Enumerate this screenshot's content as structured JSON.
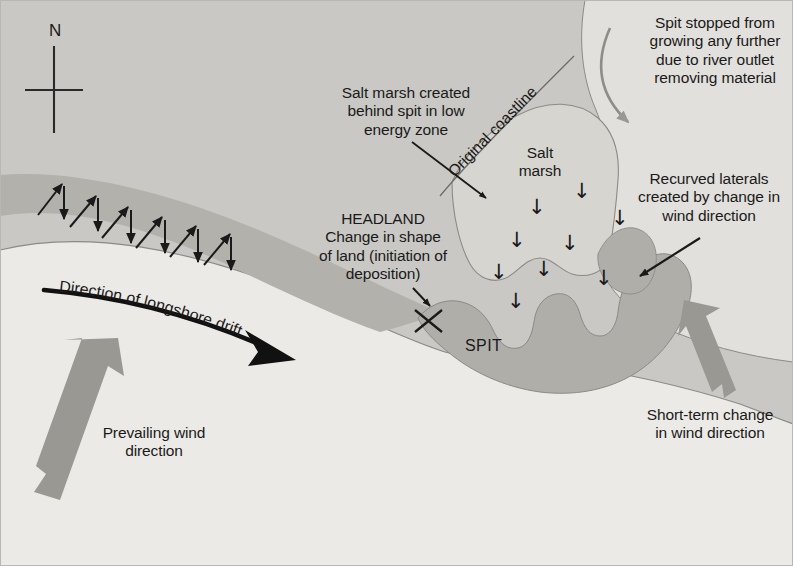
{
  "diagram": {
    "colors": {
      "sea": "#c9c8c4",
      "land": "#eceae6",
      "beach_band": "#b3b1ac",
      "spit": "#b0aea9",
      "salt_marsh": "#d6d5d0",
      "estuary": "#e2e0dc",
      "ink": "#1a1a1a",
      "gray_arrow": "#9a9893",
      "outline": "#8c8a86",
      "border": "#b9b7b4"
    },
    "labels": {
      "north": "N",
      "salt_marsh_note": "Salt marsh created\nbehind spit in low\nenergy zone",
      "headland": "HEADLAND\nChange in shape\nof land (initiation of\ndeposition)",
      "original_coastline": "Original coastline",
      "spit_stopped": "Spit stopped from\ngrowing any further\ndue to river outlet\nremoving material",
      "recurved_laterals": "Recurved laterals\ncreated by change in\nwind direction",
      "short_term_change": "Short-term change\nin wind direction",
      "longshore_drift": "Direction of longshore drift",
      "prevailing_wind": "Prevailing wind\ndirection",
      "salt_marsh": "Salt\nmarsh",
      "spit": "SPIT"
    },
    "marsh_arrow_glyph": "↓",
    "marsh_arrows": [
      {
        "x": 573,
        "y": 181
      },
      {
        "x": 528,
        "y": 197
      },
      {
        "x": 611,
        "y": 208
      },
      {
        "x": 508,
        "y": 230
      },
      {
        "x": 561,
        "y": 233
      },
      {
        "x": 490,
        "y": 262
      },
      {
        "x": 535,
        "y": 259
      },
      {
        "x": 595,
        "y": 268
      },
      {
        "x": 507,
        "y": 291
      }
    ],
    "swash_arrows": [
      {
        "x1": 38,
        "y1": 215,
        "x2": 62,
        "y2": 184
      },
      {
        "x1": 70,
        "y1": 227,
        "x2": 96,
        "y2": 196
      },
      {
        "x1": 102,
        "y1": 238,
        "x2": 128,
        "y2": 207
      },
      {
        "x1": 136,
        "y1": 248,
        "x2": 162,
        "y2": 217
      },
      {
        "x1": 170,
        "y1": 257,
        "x2": 196,
        "y2": 226
      },
      {
        "x1": 204,
        "y1": 265,
        "x2": 230,
        "y2": 234
      }
    ],
    "backwash_arrows": [
      {
        "x1": 64,
        "y1": 186,
        "x2": 64,
        "y2": 219
      },
      {
        "x1": 98,
        "y1": 198,
        "x2": 98,
        "y2": 231
      },
      {
        "x1": 131,
        "y1": 210,
        "x2": 131,
        "y2": 243
      },
      {
        "x1": 165,
        "y1": 220,
        "x2": 165,
        "y2": 253
      },
      {
        "x1": 198,
        "y1": 229,
        "x2": 198,
        "y2": 262
      },
      {
        "x1": 231,
        "y1": 237,
        "x2": 231,
        "y2": 270
      }
    ]
  }
}
